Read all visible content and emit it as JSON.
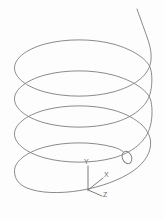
{
  "figure": {
    "background_color": "#fdfdfd",
    "stroke_color": "#7d7d7d",
    "canvas": {
      "width": 164,
      "height": 219
    }
  },
  "axes": {
    "origin": {
      "x": 88,
      "y": 190
    },
    "labels": {
      "y": "Y",
      "x": "X",
      "z": "Z"
    },
    "label_positions": {
      "y": {
        "x": 84,
        "y": 164
      },
      "x": {
        "x": 104,
        "y": 177
      },
      "z": {
        "x": 103,
        "y": 197
      }
    },
    "tips": {
      "y": {
        "x": 88,
        "y": 166
      },
      "x": {
        "x": 103,
        "y": 178
      },
      "z": {
        "x": 102,
        "y": 196
      }
    }
  },
  "helix": {
    "turns": 2.5,
    "start_point": {
      "x": 137,
      "y": 9
    },
    "end_point": {
      "x": 122,
      "y": 156
    },
    "center_x": 83,
    "radius_x": 69,
    "radius_y": 27,
    "top_y": 70,
    "pitch": 51,
    "path": "M 137.0 9.0 C 140.8 20.0 145.0 31.0 148.4 41.0 C 151.0 49.5 152.0 57.5 150.3 64.0 C 147.0 77.0 133.0 86.5 113.0 92.0 C 92.0 97.5 66.0 97.5 45.0 92.0 C 25.0 86.5 14.5 77.0 14.5 68.0 C 14.5 59.0 25.0 49.5 45.0 44.0 C 66.0 38.5 92.0 38.5 113.0 44.0 C 133.0 49.5 147.0 59.0 150.3 68.0 C 152.2 73.5 152.5 83.5 150.5 92.0 C 147.5 106.5 133.0 117.5 113.0 123.0 C 92.0 128.5 66.0 128.5 45.0 123.0 C 25.0 117.5 14.5 108.0 14.5 99.0 C 14.5 90.0 25.0 80.5 45.0 75.0 C 66.0 69.5 92.0 69.5 113.0 75.0 C 133.0 80.5 147.0 90.0 150.3 99.0 C 152.4 105.0 152.8 117.0 150.3 126.0 C 146.5 141.0 133.0 152.5 113.0 158.0 C 92.0 163.5 66.0 163.5 45.0 158.0 C 25.0 152.5 14.5 143.0 14.5 134.0 C 14.5 125.0 25.0 115.5 45.0 110.0 C 66.0 104.5 92.0 104.5 113.0 110.0 C 126.0 113.6 135.5 119.0 142.0 125.0",
    "tail_path": "M 142.0 125.0 C 147.0 130.0 150.0 135.5 150.5 141.0 C 151.5 151.0 146.0 162.0 133.0 171.0 C 120.0 180.0 101.0 187.0 80.0 190.5 C 59.0 194.0 39.0 193.0 27.0 188.0 C 18.5 184.4 14.5 178.5 14.5 171.0 C 14.5 162.0 25.0 152.5 45.0 147.0 C 66.0 141.5 92.0 141.5 113.0 147.0 C 118.0 148.3 121.5 150.0 123.5 152.0",
    "marker": {
      "name": "helix-endpoint-marker",
      "cx": 127.0,
      "cy": 157.5,
      "rx": 4.6,
      "ry": 6.4,
      "rotation": -22
    }
  }
}
